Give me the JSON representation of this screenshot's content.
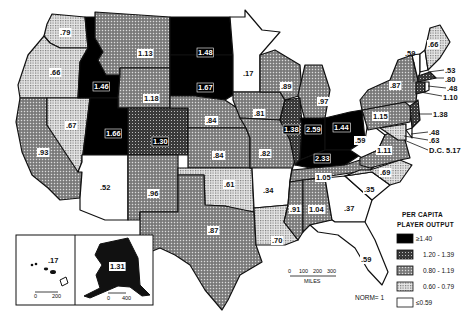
{
  "legend": {
    "title_line1": "PER CAPITA",
    "title_line2": "PLAYER OUTPUT",
    "classes": [
      {
        "label": "≥1.40",
        "pattern": "black"
      },
      {
        "label": "1.20 - 1.39",
        "pattern": "dark"
      },
      {
        "label": "0.80 - 1.19",
        "pattern": "medium"
      },
      {
        "label": "0.60 - 0.79",
        "pattern": "light"
      },
      {
        "label": "≤0.59",
        "pattern": "white"
      }
    ]
  },
  "norm_label": "NORM= 1",
  "scale": {
    "ticks": [
      "0",
      "100",
      "200",
      "300"
    ],
    "unit": "MILES"
  },
  "insets": {
    "hawaii": {
      "value": ".17",
      "scale": [
        "0",
        "200"
      ]
    },
    "alaska": {
      "value": "1.31",
      "scale": [
        "0",
        "400"
      ]
    }
  },
  "states": {
    "WA": ".79",
    "OR": ".66",
    "CA": ".93",
    "NV": ".67",
    "ID": "1.46",
    "MT": "1.13",
    "WY": "1.18",
    "UT": "1.66",
    "CO": "1.30",
    "AZ": ".52",
    "NM": ".96",
    "ND": "1.48",
    "SD": "1.67",
    "NE": ".84",
    "KS": ".84",
    "OK": ".61",
    "TX": ".87",
    "MN": ".17",
    "IA": ".81",
    "MO": ".82",
    "AR": ".34",
    "LA": ".70",
    "WI": ".89",
    "IL": "1.38",
    "MI": ".97",
    "IN": "2.59",
    "OH": "1.44",
    "KY": "2.33",
    "TN": "1.05",
    "MS": ".91",
    "AL": "1.04",
    "GA": ".37",
    "FL": ".59",
    "SC": ".35",
    "NC": ".69",
    "VA": "1.11",
    "WV": ".59",
    "PA": "1.15",
    "NY": ".87",
    "VT": ".59",
    "ME": ".66",
    "NH": ".53",
    "MA": ".80",
    "RI": ".48",
    "CT": "1.10",
    "NJ": "1.38",
    "DE": ".48",
    "MD": ".63",
    "DC": "D.C. 5.17"
  }
}
